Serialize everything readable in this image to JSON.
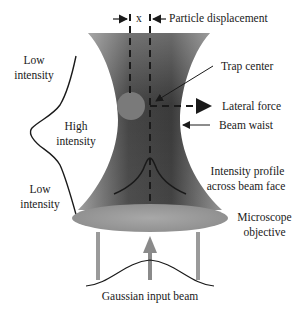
{
  "diagram": {
    "title_labels": {
      "displacement_symbol": "x",
      "particle_displacement": "Particle displacement",
      "trap_center": "Trap center",
      "lateral_force": "Lateral force",
      "beam_waist": "Beam waist",
      "intensity_profile_line1": "Intensity profile",
      "intensity_profile_line2": "across beam face",
      "microscope_line1": "Microscope",
      "microscope_line2": "objective",
      "gaussian_input": "Gaussian input beam",
      "low_top_line1": "Low",
      "low_top_line2": "intensity",
      "high_line1": "High",
      "high_line2": "intensity",
      "low_bottom_line1": "Low",
      "low_bottom_line2": "intensity"
    },
    "colors": {
      "beam_dark": "#3d3d3d",
      "beam_light": "#8a8a8a",
      "objective": "#9a9a9a",
      "particle": "#7a7a7a",
      "line": "#1a1a1a"
    }
  }
}
